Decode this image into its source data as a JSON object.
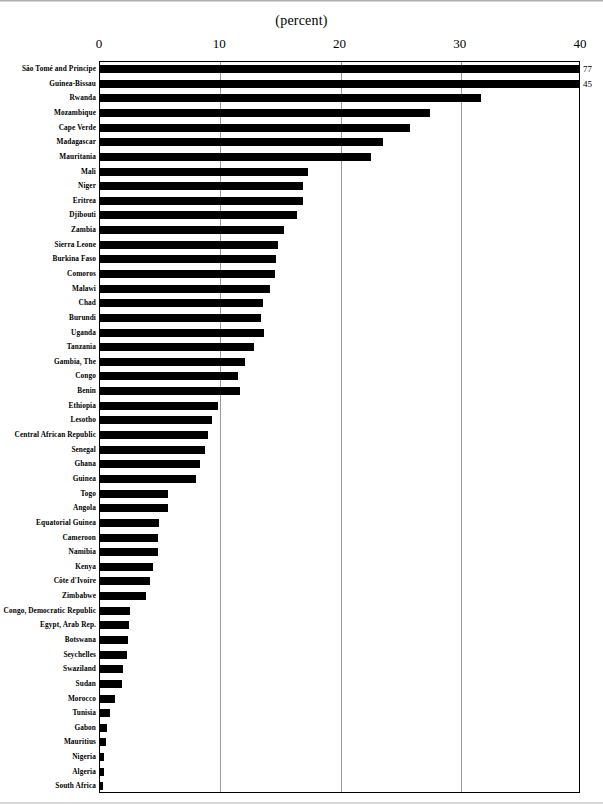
{
  "chart_data": {
    "type": "bar",
    "orientation": "horizontal",
    "title": "(percent)",
    "xlabel": "",
    "ylabel": "",
    "xlim": [
      0,
      40
    ],
    "xticks": [
      0,
      10,
      20,
      30,
      40
    ],
    "xtick_labels": [
      "0",
      "10",
      "20",
      "30",
      "40"
    ],
    "grid": true,
    "grid_axis": "x",
    "legend": false,
    "bar_color": "#000000",
    "categories": [
      "São Tomé and Principe",
      "Guinea-Bissau",
      "Rwanda",
      "Mozambique",
      "Cape Verde",
      "Madagascar",
      "Mauritania",
      "Mali",
      "Niger",
      "Eritrea",
      "Djibouti",
      "Zambia",
      "Sierra Leone",
      "Burkina Faso",
      "Comoros",
      "Malawi",
      "Chad",
      "Burundi",
      "Uganda",
      "Tanzania",
      "Gambia, The",
      "Congo",
      "Benin",
      "Ethiopia",
      "Lesotho",
      "Central African Republic",
      "Senegal",
      "Ghana",
      "Guinea",
      "Togo",
      "Angola",
      "Equatorial Guinea",
      "Cameroon",
      "Namibia",
      "Kenya",
      "Côte d'Ivoire",
      "Zimbabwe",
      "Congo, Democratic  Republic",
      "Egypt,  Arab Rep.",
      "Botswana",
      "Seychelles",
      "Swaziland",
      "Sudan",
      "Morocco",
      "Tunisia",
      "Gabon",
      "Mauritius",
      "Nigeria",
      "Algeria",
      "South Africa"
    ],
    "values": [
      77.0,
      45.0,
      31.8,
      27.5,
      25.9,
      23.6,
      22.6,
      17.4,
      17.0,
      17.0,
      16.5,
      15.4,
      14.9,
      14.7,
      14.6,
      14.2,
      13.6,
      13.5,
      13.7,
      12.9,
      12.1,
      11.6,
      11.7,
      9.9,
      9.4,
      9.1,
      8.8,
      8.4,
      8.1,
      5.7,
      5.7,
      5.0,
      4.9,
      4.9,
      4.5,
      4.2,
      3.9,
      2.6,
      2.5,
      2.4,
      2.3,
      2.0,
      1.9,
      1.3,
      0.9,
      0.7,
      0.6,
      0.4,
      0.4,
      0.3
    ],
    "value_labels": [
      "77",
      "45",
      "",
      "",
      "",
      "",
      "",
      "",
      "",
      "",
      "",
      "",
      "",
      "",
      "",
      "",
      "",
      "",
      "",
      "",
      "",
      "",
      "",
      "",
      "",
      "",
      "",
      "",
      "",
      "",
      "",
      "",
      "",
      "",
      "",
      "",
      "",
      "",
      "",
      "",
      "",
      "",
      "",
      "",
      "",
      "",
      "",
      "",
      "",
      ""
    ],
    "clipped_bars": [
      0,
      1
    ],
    "note": "Bars for Sao Tome and Principe (77) and Guinea-Bissau (45) exceed the 40 axis maximum and are drawn clipped to the plot edge with their values printed at the right."
  }
}
